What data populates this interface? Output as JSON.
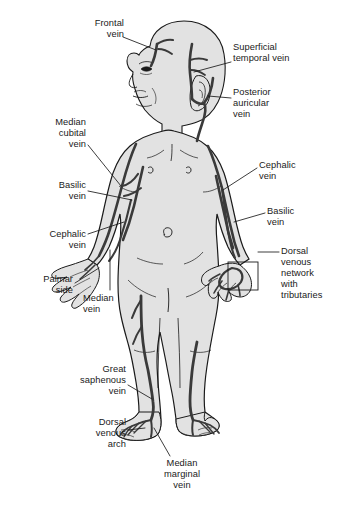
{
  "figure": {
    "colors": {
      "background": "#ffffff",
      "skin_fill": "#e2e2e2",
      "outline": "#1a1a1a",
      "vein": "#3a3a3a",
      "leader_line": "#1a1a1a",
      "text": "#1a1a1a"
    }
  },
  "labels": [
    {
      "id": "frontal-vein",
      "text": "Frontal\nvein",
      "align": "right",
      "x": 58,
      "y": 18,
      "width": 66
    },
    {
      "id": "superficial-temporal",
      "text": "Superficial\ntemporal vein",
      "align": "left",
      "x": 233,
      "y": 42,
      "width": 108
    },
    {
      "id": "posterior-auricular",
      "text": "Posterior\nauricular\nvein",
      "align": "left",
      "x": 233,
      "y": 87,
      "width": 86
    },
    {
      "id": "median-cubital",
      "text": "Median\ncubital\nvein",
      "align": "right",
      "x": 24,
      "y": 117,
      "width": 62
    },
    {
      "id": "basilic-vein-left",
      "text": "Basilic\nvein",
      "align": "right",
      "x": 24,
      "y": 180,
      "width": 62
    },
    {
      "id": "cephalic-vein-left",
      "text": "Cephalic\nvein",
      "align": "right",
      "x": 11,
      "y": 229,
      "width": 75
    },
    {
      "id": "palmar-side",
      "text": "Palmar\nside",
      "align": "right",
      "x": 11,
      "y": 274,
      "width": 62
    },
    {
      "id": "median-vein",
      "text": "Median\nvein",
      "align": "left",
      "x": 83,
      "y": 293,
      "width": 62
    },
    {
      "id": "cephalic-vein-right",
      "text": "Cephalic\nvein",
      "align": "left",
      "x": 259,
      "y": 160,
      "width": 72
    },
    {
      "id": "basilic-vein-right",
      "text": "Basilic\nvein",
      "align": "left",
      "x": 267,
      "y": 206,
      "width": 66
    },
    {
      "id": "dorsal-venous-network",
      "text": "Dorsal\nvenous\nnetwork\nwith\ntributaries",
      "align": "left",
      "x": 281,
      "y": 246,
      "width": 62
    },
    {
      "id": "great-saphenous",
      "text": "Great\nsaphenous\nvein",
      "align": "right",
      "x": 58,
      "y": 364,
      "width": 68
    },
    {
      "id": "dorsal-venous-arch",
      "text": "Dorsal\nvenous\narch",
      "align": "right",
      "x": 58,
      "y": 417,
      "width": 68
    },
    {
      "id": "median-marginal",
      "text": "Median\nmarginal\nvein",
      "align": "center",
      "x": 145,
      "y": 458,
      "width": 74
    }
  ]
}
